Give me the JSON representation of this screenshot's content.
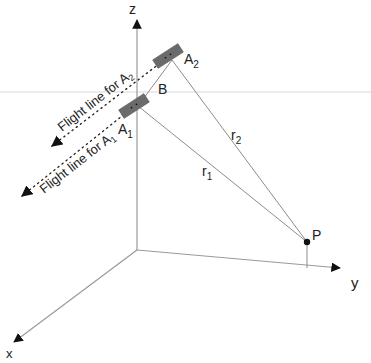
{
  "diagram": {
    "axes": {
      "x_label": "x",
      "y_label": "y",
      "z_label": "z"
    },
    "points": {
      "A1": {
        "label": "A",
        "sub": "1"
      },
      "A2": {
        "label": "A",
        "sub": "2"
      },
      "B": {
        "label": "B"
      },
      "P": {
        "label": "P"
      }
    },
    "ranges": {
      "r1": {
        "label": "r",
        "sub": "1"
      },
      "r2": {
        "label": "r",
        "sub": "2"
      }
    },
    "flight_lines": {
      "A1": {
        "text": "Flight line for A",
        "sub": "1"
      },
      "A2": {
        "text": "Flight line for A",
        "sub": "2"
      }
    },
    "colors": {
      "axis": "#9a9a9a",
      "line": "#8c8c8c",
      "sensor": "#6b6b6b",
      "text": "#222222",
      "faint_line": "#e6e6e6"
    }
  }
}
